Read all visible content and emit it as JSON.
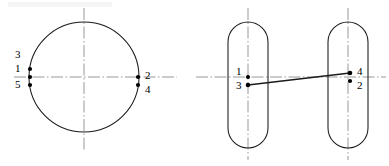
{
  "figure": {
    "background_color": "#ffffff",
    "line_color": "#1a1a1a",
    "centerline_color": "#8c8c8c",
    "dot_color": "#000000",
    "label_color": "#000000"
  },
  "left_view": {
    "name": "circle-view",
    "shape": "circle",
    "center": {
      "x": 84,
      "y": 77
    },
    "radius": 55,
    "centerlines": {
      "horizontal": {
        "x1": 14,
        "y1": 77,
        "x2": 177,
        "y2": 77
      },
      "vertical": {
        "x1": 84,
        "y1": 8,
        "x2": 84,
        "y2": 150
      }
    },
    "points": [
      {
        "id": "p1",
        "label": "1",
        "x": 30,
        "y": 69,
        "label_x": 15,
        "label_y": 63,
        "has_dot": true
      },
      {
        "id": "p-axis-left",
        "label": "",
        "x": 30,
        "y": 77,
        "has_dot": true
      },
      {
        "id": "p5",
        "label": "5",
        "x": 30,
        "y": 85,
        "label_x": 15,
        "label_y": 79,
        "has_dot": true
      },
      {
        "id": "p3",
        "label": "3",
        "x": 30,
        "y": 61,
        "label_x": 15,
        "label_y": 49,
        "has_dot": false
      },
      {
        "id": "p2",
        "label": "2",
        "x": 138,
        "y": 77,
        "label_x": 145,
        "label_y": 70,
        "has_dot": true
      },
      {
        "id": "p4",
        "label": "4",
        "x": 138,
        "y": 85,
        "label_x": 145,
        "label_y": 84,
        "has_dot": true
      }
    ]
  },
  "right_view": {
    "name": "slots-view",
    "shape": "two-rounded-slots",
    "slots": [
      {
        "id": "slot-left",
        "x": 228,
        "y": 22,
        "width": 40,
        "height": 126,
        "radius": 20,
        "center_x": 248
      },
      {
        "id": "slot-right",
        "x": 328,
        "y": 22,
        "width": 40,
        "height": 126,
        "radius": 20,
        "center_x": 348
      }
    ],
    "centerlines": {
      "horizontal": {
        "x1": 196,
        "y1": 77,
        "x2": 386,
        "y2": 77
      },
      "vertical_left": {
        "x1": 248,
        "y1": 8,
        "x2": 248,
        "y2": 160
      },
      "vertical_right": {
        "x1": 348,
        "y1": 8,
        "x2": 348,
        "y2": 160
      }
    },
    "connector": {
      "x1": 248,
      "y1": 85,
      "x2": 350,
      "y2": 73
    },
    "points": [
      {
        "id": "q1",
        "label": "1",
        "x": 248,
        "y": 77,
        "label_x": 236,
        "label_y": 66,
        "has_dot": true
      },
      {
        "id": "q3",
        "label": "3",
        "x": 248,
        "y": 85,
        "label_x": 236,
        "label_y": 80,
        "has_dot": true
      },
      {
        "id": "q4",
        "label": "4",
        "x": 350,
        "y": 73,
        "label_x": 357,
        "label_y": 66,
        "has_dot": true
      },
      {
        "id": "q2",
        "label": "2",
        "x": 350,
        "y": 81,
        "label_x": 357,
        "label_y": 80,
        "has_dot": true
      }
    ]
  }
}
